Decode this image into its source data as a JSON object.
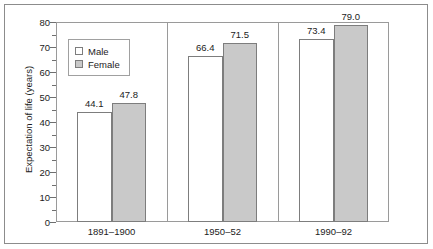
{
  "chart_data": {
    "type": "bar",
    "title": "",
    "subtitle": "",
    "xlabel": "",
    "ylabel": "Expectation of life (years)",
    "categories": [
      "1891–1900",
      "1950–52",
      "1990–92"
    ],
    "series": [
      {
        "name": "Male",
        "values": [
          44.1,
          66.4,
          73.4
        ],
        "color": "#ffffff",
        "swatch": "male-swatch"
      },
      {
        "name": "Female",
        "values": [
          47.8,
          71.5,
          79.0
        ],
        "color": "#c9c9c9",
        "swatch": "female-swatch"
      }
    ],
    "value_labels": [
      [
        "44.1",
        "66.4",
        "73.4"
      ],
      [
        "47.8",
        "71.5",
        "79.0"
      ]
    ],
    "ylim": [
      0,
      80
    ],
    "ytick_labels": [
      "80",
      "70",
      "60",
      "50",
      "40",
      "30",
      "20",
      "10",
      "0"
    ],
    "ytick_values": [
      80,
      70,
      60,
      50,
      40,
      30,
      20,
      10,
      0
    ],
    "yminor_step": 5,
    "grid": false,
    "legend": {
      "position": "upper-left-inside",
      "entries": [
        "Male",
        "Female"
      ]
    },
    "frame": true,
    "axis_color": "#9a9a9a",
    "text_color": "#1c1c1c",
    "bar_edge_color": "#7d7d7d"
  },
  "legend": {
    "male_label": "Male",
    "female_label": "Female"
  },
  "axis": {
    "y_title": "Expectation of life (years)",
    "y_ticks": [
      "80",
      "70",
      "60",
      "50",
      "40",
      "30",
      "20",
      "10",
      "0"
    ],
    "x_ticks": [
      "1891–1900",
      "1950–52",
      "1990–92"
    ]
  },
  "values": {
    "g1_male": "44.1",
    "g1_female": "47.8",
    "g2_male": "66.4",
    "g2_female": "71.5",
    "g3_male": "73.4",
    "g3_female": "79.0"
  }
}
